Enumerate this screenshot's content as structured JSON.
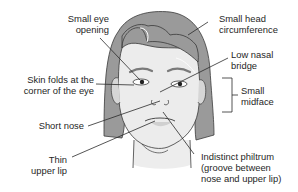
{
  "figure": {
    "labels": [
      {
        "id": "small-eye-opening",
        "lines": [
          "Small eye",
          "opening"
        ]
      },
      {
        "id": "small-head-circumference",
        "lines": [
          "Small head",
          "circumference"
        ]
      },
      {
        "id": "low-nasal-bridge",
        "lines": [
          "Low nasal",
          "bridge"
        ]
      },
      {
        "id": "skin-folds",
        "lines": [
          "Skin folds at the",
          "corner of the eye"
        ]
      },
      {
        "id": "small-midface",
        "lines": [
          "Small",
          "midface"
        ]
      },
      {
        "id": "short-nose",
        "lines": [
          "Short nose"
        ]
      },
      {
        "id": "thin-upper-lip",
        "lines": [
          "Thin",
          "upper lip"
        ]
      },
      {
        "id": "indistinct-philtrum",
        "lines": [
          "Indistinct philtrum",
          "(groove between",
          "nose and upper lip)"
        ]
      }
    ],
    "colors": {
      "hair": "#9a9a9a",
      "hair_shade": "#8a8a8a",
      "skin": "#ececec",
      "skin_shade": "#d6d6d6",
      "outline": "#3a3a3a",
      "leader": "#2a2a2a"
    }
  }
}
